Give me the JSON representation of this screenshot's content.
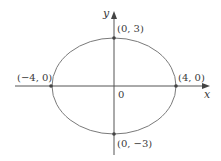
{
  "diagram": {
    "type": "ellipse-graph",
    "equation_implied": "x^2/16 + y^2/9 = 1",
    "axes": {
      "x_label": "x",
      "y_label": "y",
      "origin_label": "0"
    },
    "ellipse": {
      "center": [
        0,
        0
      ],
      "semi_major_x": 4,
      "semi_minor_y": 3
    },
    "points": [
      {
        "label": "(0, 3)",
        "x": 0,
        "y": 3
      },
      {
        "label": "(0, −3)",
        "x": 0,
        "y": -3
      },
      {
        "label": "(−4, 0)",
        "x": -4,
        "y": 0
      },
      {
        "label": "(4, 0)",
        "x": 4,
        "y": 0
      }
    ],
    "colors": {
      "stroke": "#555555",
      "curve": "#777777",
      "text": "#3a3a3a"
    }
  }
}
